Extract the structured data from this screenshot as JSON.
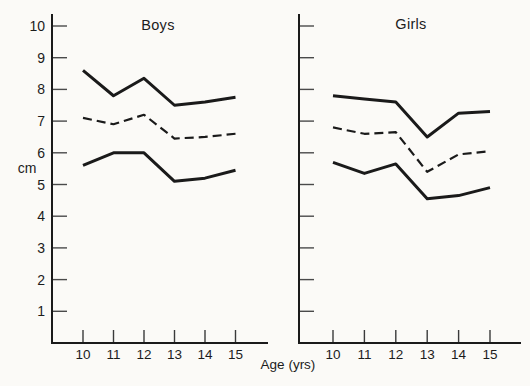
{
  "figure": {
    "background_color": "#fbfaf7",
    "ink_color": "#1a1a1a"
  },
  "chart_data": {
    "type": "line",
    "title": "",
    "xlabel": "Age (yrs)",
    "ylabel": "cm",
    "x": [
      10,
      11,
      12,
      13,
      14,
      15
    ],
    "yticks": [
      1,
      2,
      3,
      4,
      5,
      6,
      7,
      8,
      9,
      10
    ],
    "ylim": [
      0,
      10.5
    ],
    "grid": false,
    "legend": "none",
    "line_color": "#1a1a1a",
    "panels": [
      {
        "title": "Boys",
        "show_ytick_labels": true,
        "series": [
          {
            "name": "upper-curve",
            "style": "solid",
            "values": [
              8.6,
              7.8,
              8.35,
              7.5,
              7.6,
              7.75
            ]
          },
          {
            "name": "middle-curve",
            "style": "dashed",
            "values": [
              7.1,
              6.9,
              7.2,
              6.45,
              6.5,
              6.6
            ]
          },
          {
            "name": "lower-curve",
            "style": "solid",
            "values": [
              5.6,
              6.0,
              6.0,
              5.1,
              5.2,
              5.45
            ]
          }
        ]
      },
      {
        "title": "Girls",
        "show_ytick_labels": false,
        "series": [
          {
            "name": "upper-curve",
            "style": "solid",
            "values": [
              7.8,
              7.7,
              7.6,
              6.5,
              7.25,
              7.3
            ]
          },
          {
            "name": "middle-curve",
            "style": "dashed",
            "values": [
              6.8,
              6.6,
              6.65,
              5.4,
              5.95,
              6.05
            ]
          },
          {
            "name": "lower-curve",
            "style": "solid",
            "values": [
              5.7,
              5.35,
              5.65,
              4.55,
              4.65,
              4.9
            ]
          }
        ]
      }
    ]
  }
}
